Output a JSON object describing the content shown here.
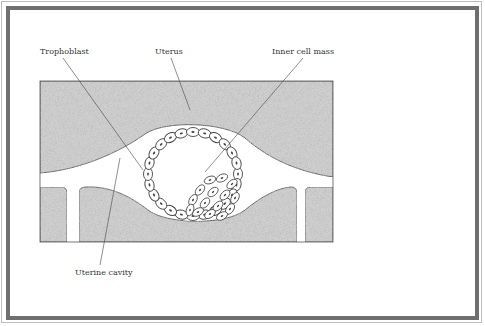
{
  "diagram": {
    "labels": {
      "trophoblast": "Trophoblast",
      "uterus": "Uterus",
      "inner_cell_mass": "Inner cell mass",
      "uterine_cavity": "Uterine cavity"
    },
    "colors": {
      "frame": "#6f6f6f",
      "tissue": "#cfcfcf",
      "outline": "#444444",
      "text": "#333333"
    }
  }
}
